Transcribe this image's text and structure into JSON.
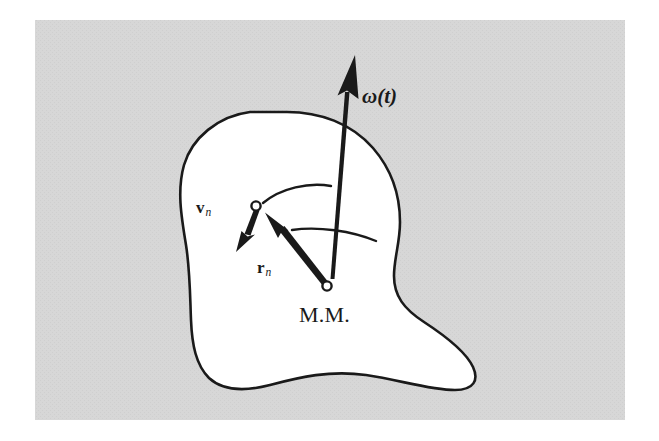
{
  "figure": {
    "caption_alt": "An irregular rigid body (blob) with angular velocity vector omega(t), position vector r_n from the mass center M.M. to a point, and velocity vector v_n at that point.",
    "background_color": "#ffffff",
    "plate_color": "#d6d6d6",
    "body_fill": "#ffffff",
    "ink_color": "#1a1a1a",
    "plate": {
      "x": 35,
      "y": 20,
      "width": 590,
      "height": 400
    },
    "labels": {
      "omega": {
        "symbol": "ω",
        "arg": "(t)",
        "full": "ω(t)",
        "x": 362,
        "y": 103
      },
      "velocity": {
        "symbol": "v",
        "subscript": "n",
        "full": "vₙ",
        "x": 196,
        "y": 213
      },
      "radius": {
        "symbol": "r",
        "subscript": "n",
        "full": "rₙ",
        "x": 257,
        "y": 273
      },
      "mass_center": {
        "text": "M.M.",
        "x": 299,
        "y": 322
      }
    },
    "markers": [
      {
        "name": "point-n",
        "cx": 256,
        "cy": 206,
        "r": 4.6
      },
      {
        "name": "mass-center",
        "cx": 327,
        "cy": 286,
        "r": 4.6
      }
    ],
    "vectors": [
      {
        "name": "omega",
        "from": [
          332,
          278
        ],
        "to": [
          355,
          57
        ],
        "label": "ω(t)"
      },
      {
        "name": "r-n",
        "from": [
          327,
          286
        ],
        "to": [
          265,
          213
        ],
        "label": "rₙ"
      },
      {
        "name": "v-n",
        "from": [
          256,
          206
        ],
        "to": [
          237,
          250
        ],
        "label": "vₙ"
      }
    ],
    "rotation_arcs": [
      {
        "name": "upper-arc",
        "from": [
          263,
          203
        ],
        "to": [
          331,
          185
        ]
      },
      {
        "name": "lower-arc",
        "from": [
          292,
          230
        ],
        "to": [
          376,
          241
        ]
      }
    ]
  }
}
